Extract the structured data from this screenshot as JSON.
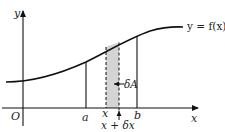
{
  "diagram": {
    "curve": {
      "label": "y = f(x)",
      "color": "#111111"
    },
    "axes": {
      "x_label": "x",
      "y_label": "y",
      "origin_label": "O"
    },
    "bounds": {
      "a_label": "a",
      "b_label": "b"
    },
    "strip": {
      "left_label": "x",
      "right_label": "x + δx",
      "area_label": "δA",
      "fill_color": "#d4d4d4",
      "edge_style": "dashed"
    }
  }
}
